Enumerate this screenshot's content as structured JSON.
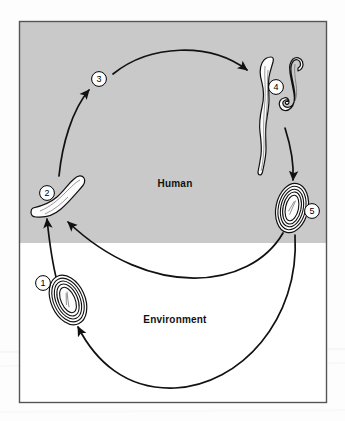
{
  "figure": {
    "frame": {
      "border_color": "#555555",
      "x": 19,
      "y": 21,
      "width": 308,
      "height": 382
    },
    "zones": [
      {
        "id": "human",
        "label": "Human",
        "background_color": "#c9c9c9",
        "label_x": 175,
        "label_y": 183
      },
      {
        "id": "environment",
        "label": "Environment",
        "background_color": "#ffffff",
        "label_x": 175,
        "label_y": 319
      }
    ],
    "divider_y": 243,
    "stages": [
      {
        "number": "1",
        "icon": "parasite-egg-icon",
        "zone": "environment",
        "label_x": 43,
        "label_y": 283,
        "shape_x": 68,
        "shape_y": 300
      },
      {
        "number": "2",
        "icon": "parasite-larva-icon",
        "zone": "human",
        "label_x": 47,
        "label_y": 193,
        "shape_x": 70,
        "shape_y": 200
      },
      {
        "number": "3",
        "icon": "migration-stage-icon",
        "zone": "human",
        "label_x": 99,
        "label_y": 79,
        "shape_x": 99,
        "shape_y": 79
      },
      {
        "number": "4",
        "icon": "adult-worm-pair-icon",
        "zone": "human",
        "label_x": 276,
        "label_y": 87,
        "shape_x": 282,
        "shape_y": 110
      },
      {
        "number": "5",
        "icon": "parasite-egg-icon",
        "zone": "human",
        "label_x": 312,
        "label_y": 211,
        "shape_x": 292,
        "shape_y": 208
      }
    ],
    "flows": [
      {
        "id": "flow-1-to-2",
        "from": "1",
        "to": "2",
        "description": "egg ingested becomes larva"
      },
      {
        "id": "flow-2-to-3",
        "from": "2",
        "to": "3",
        "description": "larva migrates"
      },
      {
        "id": "flow-3-to-4",
        "from": "3",
        "to": "4",
        "description": "larva matures into adult worms"
      },
      {
        "id": "flow-4-to-5",
        "from": "4",
        "to": "5",
        "description": "adults produce eggs"
      },
      {
        "id": "flow-5-to-2",
        "from": "5",
        "to": "2",
        "description": "eggs re-enter host"
      },
      {
        "id": "flow-5-to-1",
        "from": "5",
        "to": "1",
        "description": "eggs pass to environment"
      }
    ],
    "colors": {
      "zone_human": "#c9c9c9",
      "zone_environment": "#ffffff",
      "ink": "#111111",
      "frame": "#555555"
    }
  }
}
